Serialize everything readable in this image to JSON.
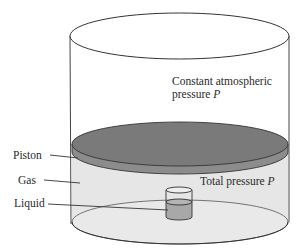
{
  "diagram": {
    "labels": {
      "atmos_line1": "Constant atmospheric",
      "atmos_line2_prefix": "pressure ",
      "atmos_var": "P",
      "total_prefix": "Total pressure ",
      "total_var": "P",
      "piston": "Piston",
      "gas": "Gas",
      "liquid": "Liquid"
    },
    "colors": {
      "outline": "#333333",
      "piston_fill": "#7a7a7a",
      "piston_edge_fill": "#8c8c8c",
      "gas_fill": "#e6e6e6",
      "liquid_fill": "#a8a8a8",
      "background": "#ffffff"
    }
  }
}
